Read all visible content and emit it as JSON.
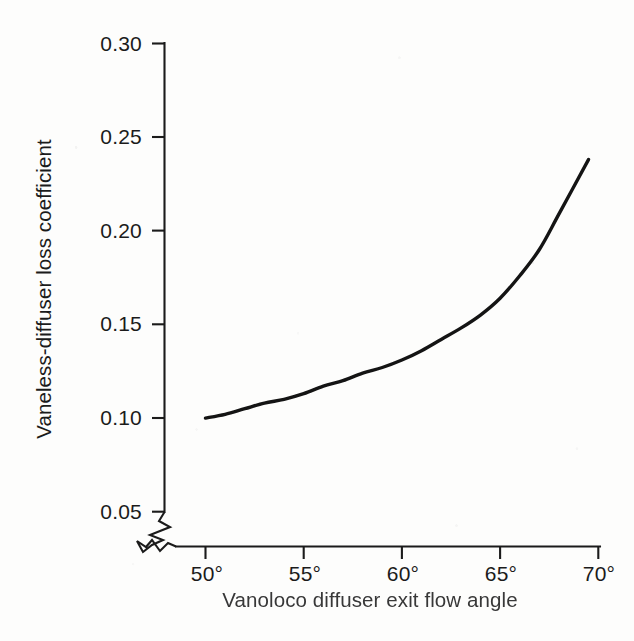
{
  "figure": {
    "background_color": "#fdfdfc",
    "ink_color": "#1b1b1b",
    "curve_color": "#141414"
  },
  "axes": {
    "y_title": "Vaneless-diffuser loss coefficient",
    "x_title": "Vanoloco diffuser exit flow angle",
    "y_tick_labels": [
      "0.30",
      "0.25",
      "0.20",
      "0.15",
      "0.10",
      "0.05"
    ],
    "x_tick_labels": [
      "50°",
      "55°",
      "60°",
      "65°",
      "70°"
    ],
    "axis_break_symbol": "zigzag-break"
  },
  "chart_data": {
    "type": "line",
    "title": "",
    "xlabel": "Vanoloco diffuser exit flow angle",
    "ylabel": "Vaneless-diffuser loss coefficient",
    "xlim": [
      50,
      70
    ],
    "ylim": [
      0.05,
      0.3
    ],
    "xticks": [
      50,
      55,
      60,
      65,
      70
    ],
    "yticks": [
      0.05,
      0.1,
      0.15,
      0.2,
      0.25,
      0.3
    ],
    "xtick_labels": [
      "50°",
      "55°",
      "60°",
      "65°",
      "70°"
    ],
    "ytick_labels": [
      "0.05",
      "0.10",
      "0.15",
      "0.20",
      "0.25",
      "0.30"
    ],
    "grid": false,
    "legend": false,
    "axis_break": {
      "x": true,
      "y": true,
      "location": "origin-corner"
    },
    "series": [
      {
        "name": "Vaneless-diffuser loss coefficient",
        "color": "#141414",
        "x": [
          50.0,
          51.0,
          52.0,
          53.0,
          54.0,
          55.0,
          56.0,
          57.0,
          58.0,
          59.0,
          60.0,
          61.0,
          62.0,
          63.0,
          64.0,
          65.0,
          66.0,
          67.0,
          68.0,
          69.5
        ],
        "y": [
          0.1,
          0.102,
          0.105,
          0.108,
          0.11,
          0.113,
          0.117,
          0.12,
          0.124,
          0.127,
          0.131,
          0.136,
          0.142,
          0.148,
          0.155,
          0.164,
          0.176,
          0.19,
          0.209,
          0.238
        ]
      }
    ]
  }
}
